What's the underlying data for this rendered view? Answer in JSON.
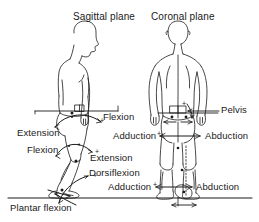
{
  "figure": {
    "width": 259,
    "height": 222,
    "background": "#ffffff",
    "line_color": "#1a1a1a",
    "text_color": "#1a1a1a"
  },
  "titles": {
    "sagittal": "Sagittal plane",
    "coronal": "Coronal plane"
  },
  "labels": {
    "hip_flexion": "Flexion",
    "hip_extension": "Extension",
    "knee_flexion": "Flexion",
    "knee_extension": "Extension",
    "dorsiflexion": "Dorsiflexion",
    "plantar_flexion": "Plantar flexion",
    "pelvis": "Pelvis",
    "hip_adduction": "Adduction",
    "hip_abduction": "Abduction",
    "foot_adduction": "Adduction",
    "foot_abduction": "Abduction"
  },
  "signs": {
    "hip_flexion_plus": "+",
    "knee_extension_plus": "+",
    "dorsiflexion_plus": "+",
    "hip_adduction_plus": "+",
    "foot_adduction_plus": "+",
    "pelvis_plus": "+"
  },
  "icons": {
    "sagittal_figure": "side-view-human-body-outline",
    "coronal_figure": "rear-view-human-body-outline",
    "ground_line": "ground-reference-line",
    "hip_axis_line": "hip-horizontal-reference-line",
    "arrow_double": "double-headed-arrow",
    "arrow_curved": "curved-rotation-arrow"
  }
}
